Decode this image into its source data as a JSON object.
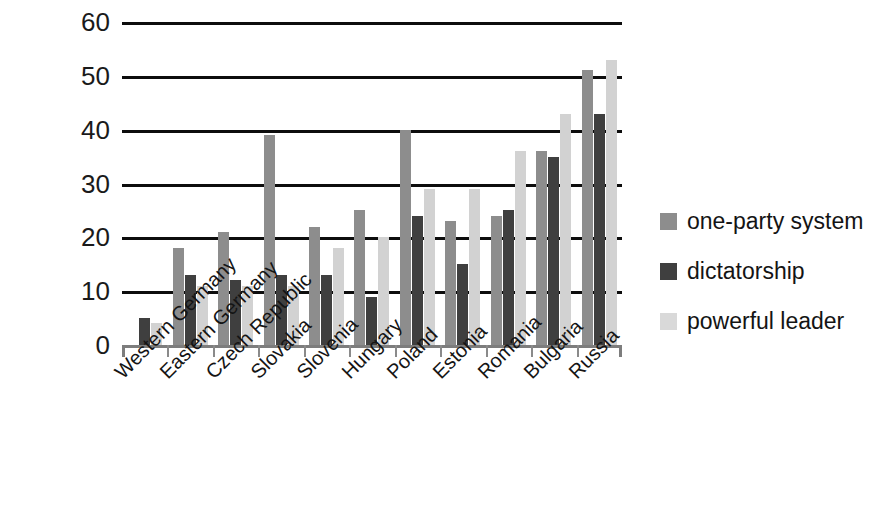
{
  "chart_data": {
    "type": "bar",
    "title": "",
    "subtitle": "",
    "xlabel": "",
    "ylabel": "",
    "ylim": [
      0,
      60
    ],
    "ytick_values": [
      60,
      50,
      40,
      30,
      20,
      10,
      0
    ],
    "ytick_labels": [
      "60",
      "50",
      "40",
      "30",
      "20",
      "10",
      "0"
    ],
    "grid": "horizontal",
    "legend_position": "right",
    "categories": [
      "Western Germany",
      "Eastern Germany",
      "Czech Republic",
      "Slovakia",
      "Slovenia",
      "Hungary",
      "Poland",
      "Estonia",
      "Romania",
      "Bulgaria",
      "Russia"
    ],
    "series": [
      {
        "name": "one-party system",
        "color": "#8d8d8d",
        "values": [
          0,
          18,
          21,
          39,
          22,
          25,
          40,
          23,
          24,
          36,
          51
        ]
      },
      {
        "name": "dictatorship",
        "color": "#3f3f3f",
        "values": [
          5,
          13,
          12,
          13,
          13,
          9,
          24,
          15,
          25,
          35,
          43
        ]
      },
      {
        "name": "powerful leader",
        "color": "#d2d2d2",
        "values": [
          4,
          11,
          11,
          11,
          18,
          20,
          29,
          29,
          36,
          43,
          53
        ]
      }
    ]
  },
  "legend": {
    "items": [
      {
        "label": "one-party system",
        "swatch": "s0"
      },
      {
        "label": "dictatorship",
        "swatch": "s1"
      },
      {
        "label": "powerful leader",
        "swatch": "s2"
      }
    ]
  }
}
